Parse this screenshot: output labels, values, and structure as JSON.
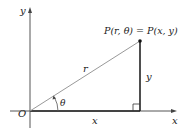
{
  "diagram": {
    "axes": {
      "x_label": "x",
      "y_label": "y",
      "origin_label": "O"
    },
    "segments": {
      "radius_label": "r",
      "horizontal_label": "x",
      "vertical_label": "y",
      "angle_label": "θ"
    },
    "point": {
      "label": "P(r, θ) = P(x, y)"
    },
    "colors": {
      "axes": "#555555",
      "radius": "#999999",
      "legs": "#222222",
      "text": "#1a1a1a"
    }
  }
}
